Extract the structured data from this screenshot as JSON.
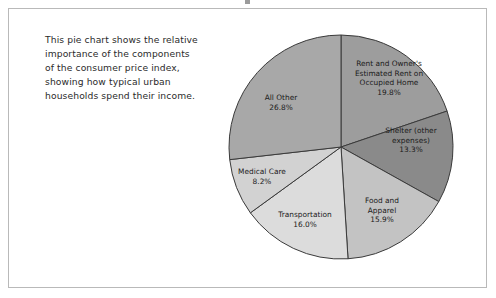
{
  "caption": {
    "lines": [
      "This pie chart shows the relative",
      "importance of the components",
      "of the consumer price index,",
      "showing how typical urban",
      "households spend their income."
    ]
  },
  "chart_data": {
    "type": "pie",
    "title": "",
    "legend": "none",
    "start_angle_deg": 0,
    "direction": "clockwise",
    "labels_inside": true,
    "total": 100.0,
    "categories": [
      "Rent and Owner's Estimated Rent on Occupied Home",
      "Shelter (other expenses)",
      "Food and Apparel",
      "Transportation",
      "Medical Care",
      "All Other"
    ],
    "values": [
      19.8,
      13.3,
      15.9,
      16.0,
      8.2,
      26.8
    ],
    "slices": [
      {
        "name": "rent-owners-estimated-rent",
        "label_lines": [
          "Rent and Owner's",
          "Estimated Rent on",
          "Occupied Home"
        ],
        "value": 19.8,
        "value_label": "19.8%",
        "color": "#9d9d9d",
        "label_x": 389,
        "label_y": 66
      },
      {
        "name": "shelter-other-expenses",
        "label_lines": [
          "Shelter (other",
          "expenses)"
        ],
        "value": 13.3,
        "value_label": "13.3%",
        "color": "#8a8a8a",
        "label_x": 411,
        "label_y": 133
      },
      {
        "name": "food-and-apparel",
        "label_lines": [
          "Food and",
          "Apparel"
        ],
        "value": 15.9,
        "value_label": "15.9%",
        "color": "#c3c3c3",
        "label_x": 382,
        "label_y": 203
      },
      {
        "name": "transportation",
        "label_lines": [
          "Transportation"
        ],
        "value": 16.0,
        "value_label": "16.0%",
        "color": "#dcdcdc",
        "label_x": 305,
        "label_y": 217
      },
      {
        "name": "medical-care",
        "label_lines": [
          "Medical Care"
        ],
        "value": 8.2,
        "value_label": "8.2%",
        "color": "#d2d2d2",
        "label_x": 262,
        "label_y": 174
      },
      {
        "name": "all-other",
        "label_lines": [
          "All Other"
        ],
        "value": 26.8,
        "value_label": "26.8%",
        "color": "#a8a8a8",
        "label_x": 281,
        "label_y": 100
      }
    ],
    "geometry": {
      "cx": 341,
      "cy": 147,
      "r": 112,
      "stroke": "#3a3a3a",
      "stroke_width": 1
    }
  }
}
